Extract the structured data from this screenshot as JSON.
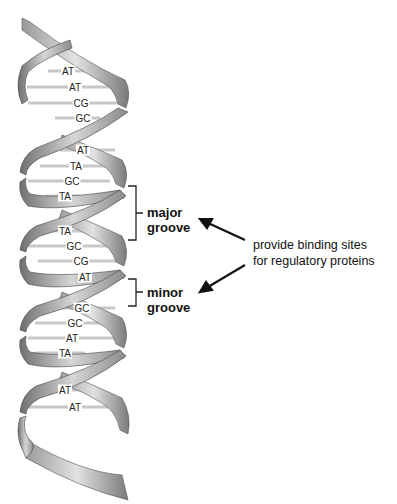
{
  "diagram": {
    "base_pairs": [
      {
        "label": "AT",
        "x": 68,
        "y": 71
      },
      {
        "label": "AT",
        "x": 75,
        "y": 87
      },
      {
        "label": "CG",
        "x": 81,
        "y": 103
      },
      {
        "label": "GC",
        "x": 83,
        "y": 118
      },
      {
        "label": "AT",
        "x": 83,
        "y": 150
      },
      {
        "label": "TA",
        "x": 76,
        "y": 166
      },
      {
        "label": "GC",
        "x": 72,
        "y": 181
      },
      {
        "label": "TA",
        "x": 65,
        "y": 196
      },
      {
        "label": "TA",
        "x": 65,
        "y": 231
      },
      {
        "label": "GC",
        "x": 74,
        "y": 246
      },
      {
        "label": "CG",
        "x": 81,
        "y": 261
      },
      {
        "label": "AT",
        "x": 85,
        "y": 277
      },
      {
        "label": "GC",
        "x": 82,
        "y": 308
      },
      {
        "label": "GC",
        "x": 75,
        "y": 323
      },
      {
        "label": "AT",
        "x": 72,
        "y": 338
      },
      {
        "label": "TA",
        "x": 65,
        "y": 353
      },
      {
        "label": "AT",
        "x": 65,
        "y": 390
      },
      {
        "label": "AT",
        "x": 75,
        "y": 407
      }
    ],
    "labels": {
      "major_line1": "major",
      "major_line2": "groove",
      "minor_line1": "minor",
      "minor_line2": "groove",
      "note_line1": "provide binding sites",
      "note_line2": "for regulatory proteins"
    },
    "colors": {
      "ribbon_light": "#d8d8d8",
      "ribbon_mid": "#a8a8a8",
      "ribbon_dark": "#6e6e6e",
      "rung": "#c4c4c4",
      "text": "#111111"
    }
  }
}
